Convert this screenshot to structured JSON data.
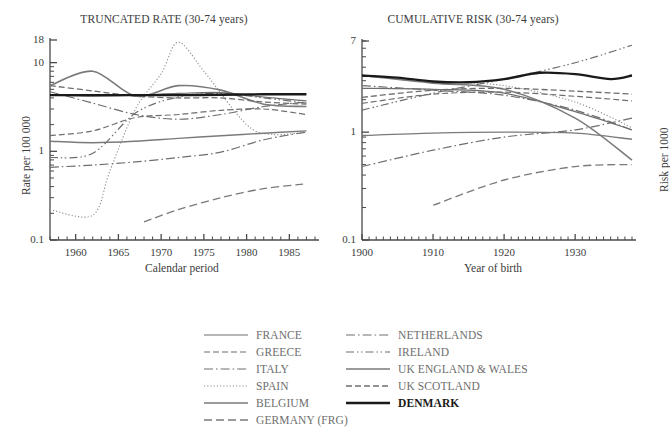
{
  "figure": {
    "panels": [
      {
        "id": "truncated-rate",
        "title": "TRUNCATED RATE (30-74 years)",
        "xlabel": "Calendar period",
        "ylabel": "Rate per 100 000"
      },
      {
        "id": "cumulative-risk",
        "title": "CUMULATIVE RISK (30-74 years)",
        "xlabel": "Year of birth",
        "ylabel": "Risk per 1000"
      }
    ]
  },
  "legend": {
    "columns": [
      {
        "entries": [
          {
            "label": "FRANCE",
            "style": "solid",
            "color": "#6e6e6e",
            "width": 1.2
          },
          {
            "label": "GREECE",
            "style": "dashed",
            "color": "#6e6e6e",
            "width": 1.2
          },
          {
            "label": "ITALY",
            "style": "dashdot",
            "color": "#6e6e6e",
            "width": 1.2
          },
          {
            "label": "SPAIN",
            "style": "dotted",
            "color": "#8d8d8d",
            "width": 1.1
          },
          {
            "label": "BELGIUM",
            "style": "solid",
            "color": "#7a7a7a",
            "width": 1.6
          },
          {
            "label": "GERMANY (FRG)",
            "style": "longdash",
            "color": "#7a7a7a",
            "width": 1.3
          }
        ]
      },
      {
        "entries": [
          {
            "label": "NETHERLANDS",
            "style": "dashdot",
            "color": "#6e6e6e",
            "width": 1.2
          },
          {
            "label": "IRELAND",
            "style": "dashdotdot",
            "color": "#6e6e6e",
            "width": 1.2
          },
          {
            "label": "UK ENGLAND & WALES",
            "style": "solid",
            "color": "#7a7a7a",
            "width": 1.4
          },
          {
            "label": "UK SCOTLAND",
            "style": "dashed",
            "color": "#6e6e6e",
            "width": 1.3
          },
          {
            "label": "DENMARK",
            "style": "solid",
            "color": "#1a1a1a",
            "width": 2.4
          }
        ]
      }
    ]
  },
  "chart_data": [
    {
      "type": "line",
      "id": "truncated-rate",
      "title": "TRUNCATED RATE (30-74 years)",
      "xlabel": "Calendar period",
      "ylabel": "Rate per 100 000",
      "xlim": [
        1957,
        1988
      ],
      "ylim": [
        0.1,
        18
      ],
      "yscale": "log",
      "xticks": [
        1960,
        1965,
        1970,
        1975,
        1980,
        1985
      ],
      "yticks": [
        0.1,
        1,
        10,
        18
      ],
      "ytick_labels": [
        "0.1",
        "1",
        "10",
        "18"
      ],
      "grid": false,
      "legend_position": "below",
      "series": [
        {
          "name": "FRANCE",
          "style": "solid",
          "color": "#6e6e6e",
          "width": 1.2,
          "x": [
            1957,
            1962,
            1967,
            1972,
            1977,
            1982,
            1987
          ],
          "y": [
            4.3,
            4.2,
            4.3,
            4.5,
            4.6,
            4.1,
            3.7
          ]
        },
        {
          "name": "GREECE",
          "style": "dashed",
          "color": "#6e6e6e",
          "width": 1.2,
          "x": [
            1957,
            1962,
            1967,
            1972,
            1977,
            1982,
            1987
          ],
          "y": [
            1.5,
            1.7,
            2.4,
            2.6,
            2.9,
            3.0,
            2.6
          ]
        },
        {
          "name": "ITALY",
          "style": "dashdot",
          "color": "#6e6e6e",
          "width": 1.2,
          "x": [
            1957,
            1962,
            1967,
            1972,
            1977,
            1982,
            1987
          ],
          "y": [
            4.7,
            3.5,
            2.6,
            2.3,
            2.6,
            3.2,
            3.6
          ]
        },
        {
          "name": "SPAIN",
          "style": "dotted",
          "color": "#8d8d8d",
          "width": 1.1,
          "x": [
            1957,
            1962,
            1964,
            1967,
            1970,
            1972,
            1975,
            1980,
            1983,
            1987
          ],
          "y": [
            0.22,
            0.19,
            0.6,
            3.0,
            7.5,
            17.0,
            8.0,
            2.0,
            1.55,
            1.65
          ]
        },
        {
          "name": "BELGIUM",
          "style": "solid",
          "color": "#7a7a7a",
          "width": 1.6,
          "x": [
            1957,
            1962,
            1967,
            1972,
            1977,
            1982,
            1987
          ],
          "y": [
            5.5,
            8.0,
            4.2,
            5.5,
            4.9,
            3.4,
            3.2
          ]
        },
        {
          "name": "GERMANY (FRG)",
          "style": "longdash",
          "color": "#7a7a7a",
          "width": 1.3,
          "x": [
            1968,
            1972,
            1977,
            1982,
            1987
          ],
          "y": [
            0.16,
            0.22,
            0.3,
            0.38,
            0.43
          ]
        },
        {
          "name": "NETHERLANDS",
          "style": "dashdot",
          "color": "#6e6e6e",
          "width": 1.2,
          "x": [
            1957,
            1962,
            1967,
            1972,
            1977,
            1982,
            1987
          ],
          "y": [
            0.66,
            0.7,
            0.76,
            0.85,
            0.98,
            1.35,
            1.65
          ]
        },
        {
          "name": "IRELAND",
          "style": "dashdotdot",
          "color": "#6e6e6e",
          "width": 1.2,
          "x": [
            1957,
            1962,
            1967,
            1972,
            1977,
            1982,
            1987
          ],
          "y": [
            0.85,
            0.95,
            2.7,
            4.1,
            4.5,
            4.0,
            3.5
          ]
        },
        {
          "name": "UK ENGLAND & WALES",
          "style": "solid",
          "color": "#7a7a7a",
          "width": 1.4,
          "x": [
            1957,
            1962,
            1967,
            1972,
            1977,
            1982,
            1987
          ],
          "y": [
            1.3,
            1.25,
            1.3,
            1.4,
            1.5,
            1.6,
            1.7
          ]
        },
        {
          "name": "UK SCOTLAND",
          "style": "dashed",
          "color": "#6e6e6e",
          "width": 1.3,
          "x": [
            1957,
            1962,
            1967,
            1972,
            1977,
            1982,
            1987
          ],
          "y": [
            5.5,
            4.8,
            4.2,
            4.0,
            4.0,
            3.6,
            3.4
          ]
        },
        {
          "name": "DENMARK",
          "style": "solid",
          "color": "#1a1a1a",
          "width": 2.4,
          "x": [
            1957,
            1962,
            1967,
            1972,
            1977,
            1982,
            1987
          ],
          "y": [
            4.3,
            4.3,
            4.3,
            4.3,
            4.35,
            4.4,
            4.4
          ]
        }
      ]
    },
    {
      "type": "line",
      "id": "cumulative-risk",
      "title": "CUMULATIVE RISK (30-74 years)",
      "xlabel": "Year of birth",
      "ylabel": "Risk per 1000",
      "xlim": [
        1900,
        1938
      ],
      "ylim": [
        0.1,
        7
      ],
      "yscale": "log",
      "xticks": [
        1900,
        1910,
        1920,
        1930
      ],
      "yticks": [
        0.1,
        1,
        7
      ],
      "ytick_labels": [
        "0.1",
        "1",
        "7"
      ],
      "grid": false,
      "legend_position": "below",
      "series": [
        {
          "name": "FRANCE",
          "style": "solid",
          "color": "#6e6e6e",
          "width": 1.2,
          "x": [
            1900,
            1910,
            1920,
            1930,
            1938
          ],
          "y": [
            2.55,
            2.5,
            2.3,
            1.55,
            1.05
          ]
        },
        {
          "name": "GREECE",
          "style": "dashed",
          "color": "#6e6e6e",
          "width": 1.2,
          "x": [
            1900,
            1910,
            1920,
            1930,
            1938
          ],
          "y": [
            1.85,
            2.25,
            2.35,
            2.15,
            1.95
          ]
        },
        {
          "name": "ITALY",
          "style": "dashdot",
          "color": "#6e6e6e",
          "width": 1.2,
          "x": [
            1900,
            1910,
            1920,
            1930,
            1938
          ],
          "y": [
            2.7,
            2.45,
            2.2,
            1.6,
            1.05
          ]
        },
        {
          "name": "SPAIN",
          "style": "dotted",
          "color": "#8d8d8d",
          "width": 1.1,
          "x": [
            1900,
            1910,
            1920,
            1930,
            1938
          ],
          "y": [
            3.35,
            2.95,
            2.7,
            1.9,
            1.1
          ]
        },
        {
          "name": "BELGIUM",
          "style": "solid",
          "color": "#7a7a7a",
          "width": 1.6,
          "x": [
            1900,
            1910,
            1920,
            1930,
            1938
          ],
          "y": [
            3.35,
            2.85,
            2.5,
            1.35,
            0.55
          ]
        },
        {
          "name": "GERMANY (FRG)",
          "style": "longdash",
          "color": "#7a7a7a",
          "width": 1.3,
          "x": [
            1910,
            1920,
            1930,
            1938
          ],
          "y": [
            0.21,
            0.36,
            0.48,
            0.5
          ]
        },
        {
          "name": "NETHERLANDS",
          "style": "dashdot",
          "color": "#6e6e6e",
          "width": 1.2,
          "x": [
            1900,
            1910,
            1920,
            1930,
            1938
          ],
          "y": [
            0.48,
            0.68,
            0.9,
            1.05,
            1.35
          ]
        },
        {
          "name": "IRELAND",
          "style": "dashdotdot",
          "color": "#6e6e6e",
          "width": 1.2,
          "x": [
            1900,
            1910,
            1920,
            1930,
            1938
          ],
          "y": [
            1.6,
            2.3,
            3.1,
            4.4,
            6.4
          ]
        },
        {
          "name": "UK ENGLAND & WALES",
          "style": "solid",
          "color": "#7a7a7a",
          "width": 1.4,
          "x": [
            1900,
            1910,
            1920,
            1930,
            1938
          ],
          "y": [
            0.93,
            0.98,
            1.0,
            0.98,
            0.86
          ]
        },
        {
          "name": "UK SCOTLAND",
          "style": "dashed",
          "color": "#6e6e6e",
          "width": 1.3,
          "x": [
            1900,
            1910,
            1920,
            1930,
            1938
          ],
          "y": [
            2.1,
            2.45,
            2.55,
            2.4,
            2.25
          ]
        },
        {
          "name": "DENMARK",
          "style": "solid",
          "color": "#1a1a1a",
          "width": 2.4,
          "x": [
            1900,
            1905,
            1910,
            1915,
            1920,
            1925,
            1930,
            1935,
            1938
          ],
          "y": [
            3.35,
            3.2,
            2.95,
            2.9,
            3.1,
            3.55,
            3.45,
            3.1,
            3.35
          ]
        }
      ]
    }
  ]
}
